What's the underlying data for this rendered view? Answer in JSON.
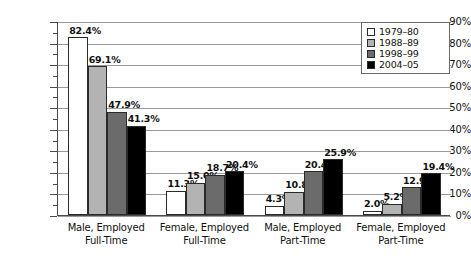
{
  "chart_data": {
    "type": "bar",
    "title": "",
    "subtitle": "",
    "xlabel": "",
    "ylabel": "",
    "ylim": [
      0,
      90
    ],
    "ytick_step": 10,
    "yminor_step": 5,
    "grid": true,
    "grid_axis": "y",
    "legend_position": "top-right",
    "value_format": "percent",
    "categories": [
      "Male, Employed\nFull-Time",
      "Female, Employed\nFull-Time",
      "Male, Employed\nPart-Time",
      "Female, Employed\nPart-Time"
    ],
    "ytick_labels": [
      "0%",
      "10%",
      "20%",
      "30%",
      "40%",
      "50%",
      "60%",
      "70%",
      "80%",
      "90%"
    ],
    "series": [
      {
        "name": "1979–80",
        "color": "#ffffff",
        "values": [
          82.4,
          11.3,
          4.3,
          2.0
        ]
      },
      {
        "name": "1988–89",
        "color": "#b3b3b3",
        "values": [
          69.1,
          15.0,
          10.8,
          5.2
        ]
      },
      {
        "name": "1998–99",
        "color": "#6b6b6b",
        "values": [
          47.9,
          18.7,
          20.4,
          12.9
        ]
      },
      {
        "name": "2004–05",
        "color": "#000000",
        "values": [
          41.3,
          20.4,
          25.9,
          19.4
        ]
      }
    ],
    "data_labels": [
      [
        "82.4%",
        "69.1%",
        "47.9%",
        "41.3%"
      ],
      [
        "11.3%",
        "15.0%",
        "18.7%",
        "20.4%"
      ],
      [
        "4.3%",
        "10.8%",
        "20.4%",
        "25.9%"
      ],
      [
        "2.0%",
        "5.2%",
        "12.9%",
        "19.4%"
      ]
    ]
  },
  "category_lines": [
    [
      "Male, Employed",
      "Full-Time"
    ],
    [
      "Female, Employed",
      "Full-Time"
    ],
    [
      "Male, Employed",
      "Part-Time"
    ],
    [
      "Female, Employed",
      "Part-Time"
    ]
  ],
  "colors": {
    "series_1979_80": "#ffffff",
    "series_1988_89": "#b3b3b3",
    "series_1998_99": "#6b6b6b",
    "series_2004_05": "#000000",
    "gridline": "#9a9a9a",
    "axis": "#4a4a4a",
    "background": "#ffffff",
    "text": "#111111"
  }
}
